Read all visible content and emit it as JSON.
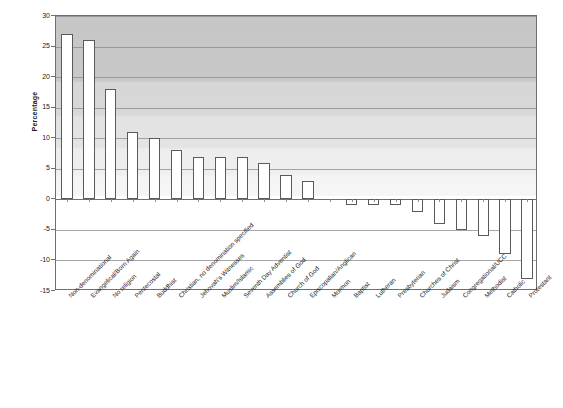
{
  "chart_data": {
    "type": "bar",
    "title": "",
    "subtitle": "",
    "xlabel": "",
    "ylabel": "Percentage",
    "ylim": [
      -15,
      30
    ],
    "ytick_step": 5,
    "yticks": [
      30,
      25,
      20,
      15,
      10,
      5,
      0,
      -5,
      -10,
      -15
    ],
    "ytick_labels": [
      "30",
      "25",
      "20",
      "15",
      "10",
      "5",
      "0",
      "-5",
      "-10",
      "-15"
    ],
    "grid": true,
    "legend": null,
    "legend_position": "none",
    "bar_face_color": "#ffffff",
    "bar_edge_color": "#5a5a5a",
    "plot_positive_background": "#d8d8d8",
    "plot_negative_background": "#ffffff",
    "axis_color": "#6f6f6f",
    "categories": [
      "Non-denominational",
      "Evangelical/Born Again",
      "No religion",
      "Pentecostal",
      "Buddhist",
      "Christian, no denomination specified",
      "Jehovah's Witnesses",
      "Muslim/Islamic",
      "Seventh Day Adventist",
      "Assemblies of God",
      "Church of God",
      "Episcopalian/Anglican",
      "Mormon",
      "Baptist",
      "Lutheran",
      "Presbyterian",
      "Churches of Christ",
      "Judaism",
      "Congregational/UCC",
      "Methodist",
      "Catholic",
      "Protestant"
    ],
    "values": [
      27,
      26,
      18,
      11,
      10,
      8,
      7,
      7,
      7,
      6,
      4,
      3,
      0,
      -1,
      -1,
      -1,
      -2,
      -4,
      -5,
      -6,
      -9,
      -13
    ]
  },
  "axis": {
    "y_title": "Percentage"
  }
}
